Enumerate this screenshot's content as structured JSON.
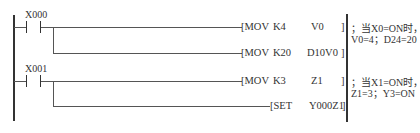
{
  "diagram": {
    "type": "PLC ladder diagram",
    "rungs": [
      {
        "contact": "X000",
        "instructions": [
          {
            "op": "[MOV",
            "arg1": "K4",
            "arg2": "V0",
            "close": "]"
          },
          {
            "op": "[MOV",
            "arg1": "K20",
            "arg2": "D10V0",
            "close": "]"
          }
        ],
        "comment_line1": "；当X0=ON时，",
        "comment_line2": "V0=4；D24=20"
      },
      {
        "contact": "X001",
        "instructions": [
          {
            "op": "[MOV",
            "arg1": "K3",
            "arg2": "Z1",
            "close": "]"
          },
          {
            "op": "[SET",
            "arg1": "",
            "arg2": "Y000Z1",
            "close": "]"
          }
        ],
        "comment_line1": "；当X1=ON时，",
        "comment_line2": "Z1=3；Y3=ON"
      }
    ],
    "colors": {
      "line": "#333333",
      "background": "#ffffff"
    }
  }
}
